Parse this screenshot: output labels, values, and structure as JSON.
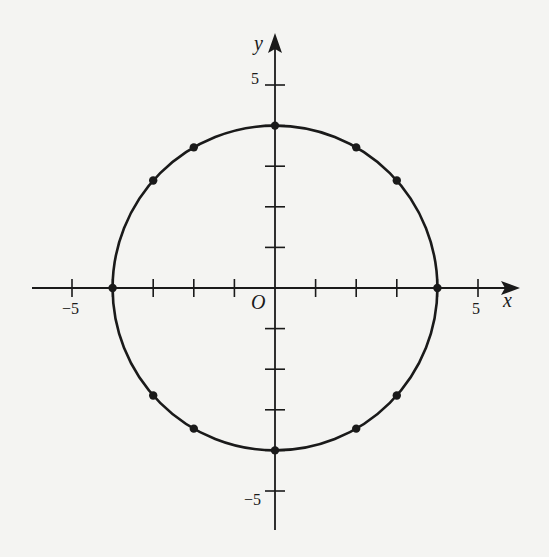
{
  "figure": {
    "x_axis_label": "x",
    "y_axis_label": "y",
    "origin_label": "O",
    "tick_labels": {
      "x_neg": "−5",
      "x_pos": "5",
      "y_pos": "5",
      "y_neg": "−5"
    },
    "circle": {
      "center": [
        0,
        0
      ],
      "radius": 4,
      "equation": "x^2 + y^2 = 16"
    },
    "points": [
      [
        4,
        0
      ],
      [
        -4,
        0
      ],
      [
        0,
        4
      ],
      [
        0,
        -4
      ],
      [
        2,
        3.464
      ],
      [
        -2,
        3.464
      ],
      [
        2,
        -3.464
      ],
      [
        -2,
        -3.464
      ],
      [
        3,
        2.646
      ],
      [
        -3,
        2.646
      ],
      [
        3,
        -2.646
      ],
      [
        -3,
        -2.646
      ]
    ],
    "ticks": [
      -5,
      -4,
      -3,
      -2,
      -1,
      1,
      2,
      3,
      4,
      5
    ],
    "colors": {
      "ink": "#1a1a1a",
      "paper": "#f4f4f2"
    }
  }
}
